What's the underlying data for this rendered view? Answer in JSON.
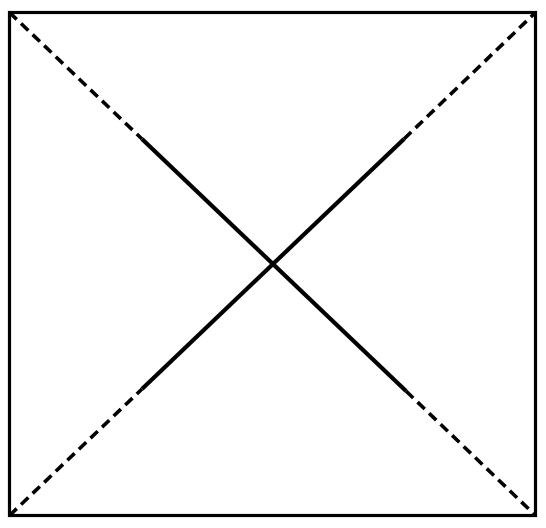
{
  "figure": {
    "canvas": {
      "width": 546,
      "height": 528,
      "background_color": "#ffffff"
    },
    "stroke_color": "#000000",
    "square": {
      "label": "square-outline",
      "left": 9.5,
      "top": 12.5,
      "right": 535.5,
      "bottom": 515.5,
      "stroke_width": 3.2
    },
    "center_point": {
      "label": "diagonal-intersection",
      "x": 272.5,
      "y": 264.0
    },
    "diagonals": [
      {
        "name": "diagonal-top-left-to-bottom-right",
        "start": {
          "x": 9.5,
          "y": 12.5
        },
        "end": {
          "x": 535.5,
          "y": 515.5
        },
        "solid_start": {
          "x": 142.0,
          "y": 139.0
        },
        "solid_end": {
          "x": 406.0,
          "y": 391.0
        },
        "solid_stroke_width": 4.2,
        "dashed_stroke_width": 3.6,
        "dash_length": 10,
        "gap_length": 6
      },
      {
        "name": "diagonal-bottom-left-to-top-right",
        "start": {
          "x": 9.5,
          "y": 515.5
        },
        "end": {
          "x": 535.5,
          "y": 12.5
        },
        "solid_start": {
          "x": 142.0,
          "y": 389.0
        },
        "solid_end": {
          "x": 404.0,
          "y": 139.0
        },
        "solid_stroke_width": 4.2,
        "dashed_stroke_width": 3.6,
        "dash_length": 10,
        "gap_length": 6
      }
    ]
  },
  "chart_data": {
    "type": "diagram",
    "xlabel": "",
    "ylabel": "",
    "grid": false,
    "legend": false,
    "annotations": [],
    "shapes": [
      {
        "kind": "rectangle",
        "name": "square-outline",
        "points": [
          [
            9.5,
            12.5
          ],
          [
            535.5,
            12.5
          ],
          [
            535.5,
            515.5
          ],
          [
            9.5,
            515.5
          ]
        ],
        "style": "solid",
        "color": "#000000",
        "width": 3.2
      },
      {
        "kind": "line",
        "name": "diagonal-1-dashed-upper",
        "points": [
          [
            9.5,
            12.5
          ],
          [
            142.0,
            139.0
          ]
        ],
        "style": "dashed",
        "color": "#000000",
        "width": 3.6
      },
      {
        "kind": "line",
        "name": "diagonal-1-solid-middle",
        "points": [
          [
            142.0,
            139.0
          ],
          [
            406.0,
            391.0
          ]
        ],
        "style": "solid",
        "color": "#000000",
        "width": 4.2
      },
      {
        "kind": "line",
        "name": "diagonal-1-dashed-lower",
        "points": [
          [
            406.0,
            391.0
          ],
          [
            535.5,
            515.5
          ]
        ],
        "style": "dashed",
        "color": "#000000",
        "width": 3.6
      },
      {
        "kind": "line",
        "name": "diagonal-2-dashed-lower",
        "points": [
          [
            9.5,
            515.5
          ],
          [
            142.0,
            389.0
          ]
        ],
        "style": "dashed",
        "color": "#000000",
        "width": 3.6
      },
      {
        "kind": "line",
        "name": "diagonal-2-solid-middle",
        "points": [
          [
            142.0,
            389.0
          ],
          [
            404.0,
            139.0
          ]
        ],
        "style": "solid",
        "color": "#000000",
        "width": 4.2
      },
      {
        "kind": "line",
        "name": "diagonal-2-dashed-upper",
        "points": [
          [
            404.0,
            139.0
          ],
          [
            535.5,
            12.5
          ]
        ],
        "style": "dashed",
        "color": "#000000",
        "width": 3.6
      }
    ]
  }
}
